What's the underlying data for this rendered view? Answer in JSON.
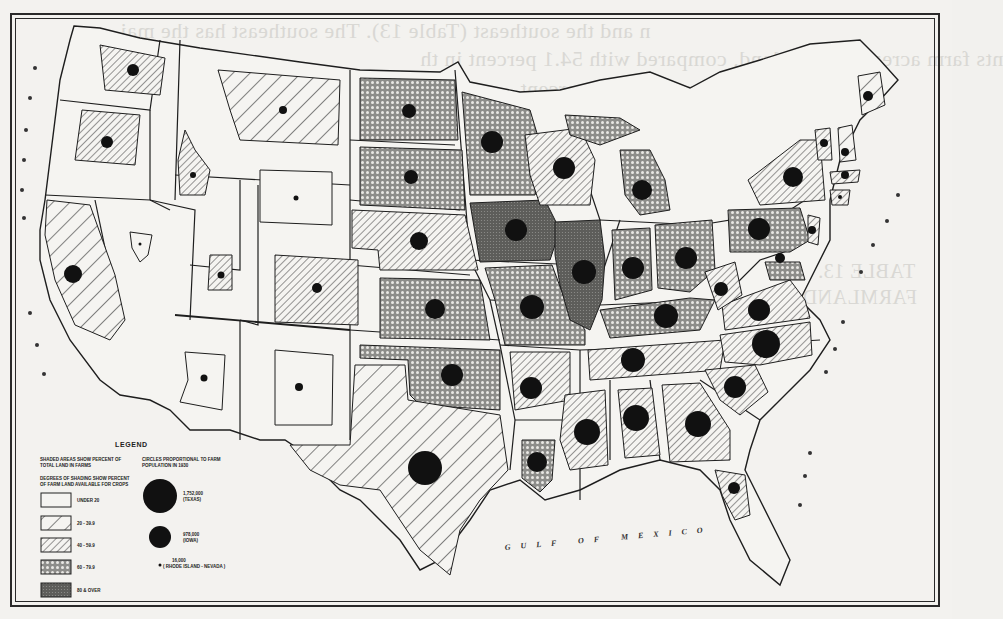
{
  "map": {
    "type": "choropleth_with_proportional_circles",
    "subject": "United States farm land and farm population by state",
    "frame": {
      "outer": "double rule border"
    },
    "ocean_labels": {
      "gulf": "GULF OF MEXICO",
      "pacific_west_coast": "PACIFIC (rendered as scattered letters along west coast)",
      "atlantic_east_coast": "ATLANTIC (rendered as scattered letters along east coast)"
    }
  },
  "legend": {
    "title": "LEGEND",
    "shading_heading_1": "SHADED AREAS SHOW PERCENT OF",
    "shading_heading_2": "TOTAL LAND IN FARMS",
    "degrees_heading_1": "DEGREES OF SHADING SHOW PERCENT",
    "degrees_heading_2": "OF FARM LAND AVAILABLE FOR CROPS",
    "classes": [
      {
        "id": "c0",
        "label": "UNDER 20",
        "pattern": "blank"
      },
      {
        "id": "c1",
        "label": "20 - 39.9",
        "pattern": "wide-diagonal"
      },
      {
        "id": "c2",
        "label": "40 - 59.9",
        "pattern": "fine-diagonal"
      },
      {
        "id": "c3",
        "label": "60 - 79.9",
        "pattern": "crosshatch-dots"
      },
      {
        "id": "c4",
        "label": "80 & OVER",
        "pattern": "dense-dark"
      }
    ],
    "circles_heading_1": "CIRCLES PROPORTIONAL TO FARM",
    "circles_heading_2": "POPULATION IN 1930",
    "circles": [
      {
        "value": "1,752,000",
        "state": "(TEXAS)",
        "size": "large"
      },
      {
        "value": "978,000",
        "state": "(IOWA)",
        "size": "medium"
      },
      {
        "value": "16,000",
        "state": "( RHODE ISLAND - NEVADA )",
        "size": "small"
      }
    ]
  },
  "states": [
    {
      "name": "Washington",
      "class": "20 - 39.9",
      "circle": "small"
    },
    {
      "name": "Oregon",
      "class": "20 - 39.9",
      "circle": "small"
    },
    {
      "name": "California",
      "class": "20 - 39.9",
      "circle": "medium-small"
    },
    {
      "name": "Idaho",
      "class": "20 - 39.9",
      "circle": "tiny"
    },
    {
      "name": "Nevada",
      "class": "UNDER 20",
      "circle": "tiny"
    },
    {
      "name": "Montana",
      "class": "20 - 39.9",
      "circle": "tiny"
    },
    {
      "name": "Wyoming",
      "class": "UNDER 20",
      "circle": "tiny"
    },
    {
      "name": "Utah",
      "class": "20 - 39.9",
      "circle": "tiny"
    },
    {
      "name": "Colorado",
      "class": "40 - 59.9",
      "circle": "small"
    },
    {
      "name": "Arizona",
      "class": "UNDER 20",
      "circle": "tiny"
    },
    {
      "name": "New Mexico",
      "class": "UNDER 20",
      "circle": "tiny"
    },
    {
      "name": "North Dakota",
      "class": "60 - 79.9",
      "circle": "small"
    },
    {
      "name": "South Dakota",
      "class": "60 - 79.9",
      "circle": "small"
    },
    {
      "name": "Nebraska",
      "class": "40 - 59.9",
      "circle": "medium-small"
    },
    {
      "name": "Kansas",
      "class": "60 - 79.9",
      "circle": "medium-small"
    },
    {
      "name": "Oklahoma",
      "class": "60 - 79.9",
      "circle": "medium"
    },
    {
      "name": "Texas",
      "class": "20 - 39.9",
      "circle": "large"
    },
    {
      "name": "Minnesota",
      "class": "60 - 79.9",
      "circle": "medium"
    },
    {
      "name": "Iowa",
      "class": "80 & OVER",
      "circle": "medium"
    },
    {
      "name": "Missouri",
      "class": "60 - 79.9",
      "circle": "medium"
    },
    {
      "name": "Arkansas",
      "class": "40 - 59.9",
      "circle": "medium"
    },
    {
      "name": "Louisiana",
      "class": "60 - 79.9",
      "circle": "medium-small"
    },
    {
      "name": "Wisconsin",
      "class": "40 - 59.9",
      "circle": "medium"
    },
    {
      "name": "Illinois",
      "class": "80 & OVER",
      "circle": "medium"
    },
    {
      "name": "Michigan",
      "class": "60 - 79.9",
      "circle": "medium-small"
    },
    {
      "name": "Indiana",
      "class": "60 - 79.9",
      "circle": "medium-small"
    },
    {
      "name": "Ohio",
      "class": "60 - 79.9",
      "circle": "medium"
    },
    {
      "name": "Kentucky",
      "class": "60 - 79.9",
      "circle": "medium"
    },
    {
      "name": "Tennessee",
      "class": "40 - 59.9",
      "circle": "medium"
    },
    {
      "name": "Mississippi",
      "class": "40 - 59.9",
      "circle": "medium"
    },
    {
      "name": "Alabama",
      "class": "40 - 59.9",
      "circle": "medium"
    },
    {
      "name": "Georgia",
      "class": "40 - 59.9",
      "circle": "medium"
    },
    {
      "name": "Florida",
      "class": "40 - 59.9",
      "circle": "small"
    },
    {
      "name": "South Carolina",
      "class": "40 - 59.9",
      "circle": "medium-small"
    },
    {
      "name": "North Carolina",
      "class": "40 - 59.9",
      "circle": "medium"
    },
    {
      "name": "Virginia",
      "class": "40 - 59.9",
      "circle": "medium-small"
    },
    {
      "name": "West Virginia",
      "class": "40 - 59.9",
      "circle": "small"
    },
    {
      "name": "Pennsylvania",
      "class": "60 - 79.9",
      "circle": "medium-small"
    },
    {
      "name": "New York",
      "class": "40 - 59.9",
      "circle": "medium-small"
    },
    {
      "name": "Maryland",
      "class": "60 - 79.9",
      "circle": "small"
    },
    {
      "name": "Maine",
      "class": "20 - 39.9",
      "circle": "small"
    },
    {
      "name": "Vermont",
      "class": "40 - 59.9",
      "circle": "small"
    },
    {
      "name": "New Hampshire",
      "class": "20 - 39.9",
      "circle": "small"
    },
    {
      "name": "Massachusetts",
      "class": "40 - 59.9",
      "circle": "small"
    },
    {
      "name": "Connecticut",
      "class": "40 - 59.9",
      "circle": "tiny"
    },
    {
      "name": "New Jersey",
      "class": "40 - 59.9",
      "circle": "small"
    }
  ]
}
